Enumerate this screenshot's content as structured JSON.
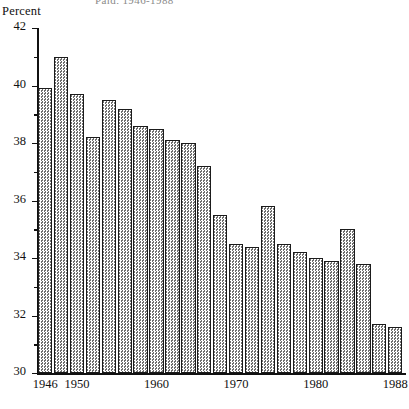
{
  "chart_data": {
    "type": "bar",
    "title": "Paid, 1946-1988",
    "ylabel": "Percent",
    "xlabel": "",
    "ylim": [
      30,
      42
    ],
    "grid": false,
    "legend": null,
    "y_ticks_major": [
      30,
      32,
      34,
      36,
      38,
      40,
      42
    ],
    "y_ticks_minor": [
      31,
      33,
      35,
      37,
      39,
      41
    ],
    "x_tick_labels": [
      "1946",
      "1950",
      "1960",
      "1970",
      "1980",
      "1988"
    ],
    "x_tick_categories": [
      "1946",
      "1950",
      "1960",
      "1970",
      "1980",
      "1988"
    ],
    "categories": [
      "1946",
      "1948",
      "1950",
      "1952",
      "1954",
      "1956",
      "1958",
      "1960",
      "1962",
      "1964",
      "1966",
      "1968",
      "1970",
      "1972",
      "1974",
      "1976",
      "1978",
      "1980",
      "1982",
      "1984",
      "1986",
      "1988",
      "1988b"
    ],
    "values": [
      39.9,
      41.0,
      39.7,
      38.2,
      39.5,
      39.2,
      38.6,
      38.5,
      38.1,
      38.0,
      37.2,
      35.5,
      34.5,
      34.4,
      35.8,
      34.5,
      34.2,
      34.0,
      33.9,
      35.0,
      33.8,
      31.7,
      31.6
    ]
  },
  "axis": {
    "unit_label": "Percent"
  }
}
